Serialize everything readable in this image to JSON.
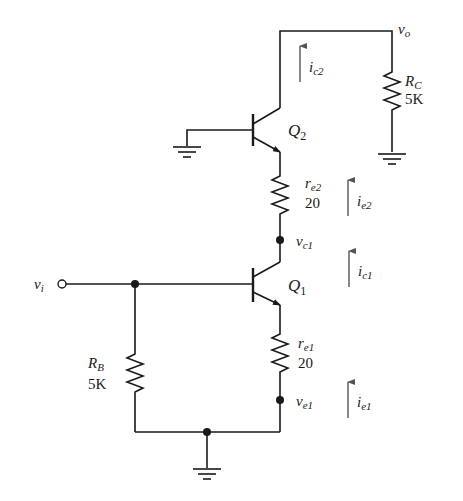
{
  "diagram": {
    "type": "circuit-schematic",
    "colors": {
      "wire": "#1a1a1a",
      "current_arrow": "#555555",
      "background": "#ffffff"
    },
    "input": {
      "label": "v",
      "sub": "i"
    },
    "output": {
      "label": "v",
      "sub": "o"
    },
    "transistors": [
      {
        "id": "Q2",
        "label": "Q",
        "sub": "2"
      },
      {
        "id": "Q1",
        "label": "Q",
        "sub": "1"
      }
    ],
    "resistors": {
      "rc": {
        "label": "R",
        "sub": "C",
        "value": "5K"
      },
      "re2": {
        "label": "r",
        "sub": "e2",
        "value": "20"
      },
      "re1": {
        "label": "r",
        "sub": "e1",
        "value": "20"
      },
      "rb": {
        "label": "R",
        "sub": "B",
        "value": "5K"
      }
    },
    "nodes": {
      "vc1": {
        "label": "v",
        "sub": "c1"
      },
      "ve1": {
        "label": "v",
        "sub": "e1"
      }
    },
    "currents": {
      "ic2": {
        "label": "i",
        "sub": "c2"
      },
      "ie2": {
        "label": "i",
        "sub": "e2"
      },
      "ic1": {
        "label": "i",
        "sub": "c1"
      },
      "ie1": {
        "label": "i",
        "sub": "e1"
      }
    }
  }
}
